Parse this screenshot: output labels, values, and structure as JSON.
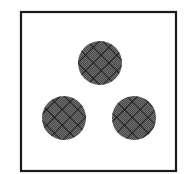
{
  "canvas": {
    "width": 184,
    "height": 174,
    "background": "#ffffff"
  },
  "frame": {
    "x": 21,
    "y": 12,
    "width": 155,
    "height": 159,
    "stroke": "#1a1a1a",
    "stroke_width": 2.2
  },
  "pattern": {
    "fill_base": "#6e6e6e",
    "stipple_color": "#4a4a4a",
    "hatch_color": "#141414",
    "hatch_spacing": 11,
    "hatch_width": 1.6
  },
  "circles": [
    {
      "id": "top",
      "cx": 100,
      "cy": 63,
      "r": 22
    },
    {
      "id": "bottom-left",
      "cx": 64,
      "cy": 118,
      "r": 22
    },
    {
      "id": "bottom-right",
      "cx": 134,
      "cy": 118,
      "r": 22
    }
  ]
}
